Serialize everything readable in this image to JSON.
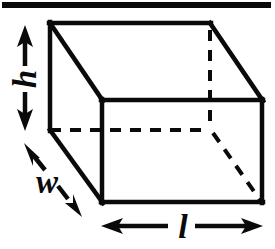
{
  "figure": {
    "kind": "geometry-diagram",
    "ink_color": "#0a0a0a",
    "background_color": "#ffffff",
    "stroke_width_solid": 4,
    "stroke_width_dashed": 4
  },
  "top_rule": {
    "name": "page-rule",
    "x1": 2,
    "y1": 5,
    "x2": 271,
    "y2": 5,
    "thickness": 6
  },
  "box": {
    "front_face": {
      "top_left": [
        102,
        100
      ],
      "top_right": [
        262,
        100
      ],
      "bottom_right": [
        262,
        202
      ],
      "bottom_left": [
        102,
        202
      ]
    },
    "back_face": {
      "top_left": [
        50,
        23
      ],
      "top_right": [
        210,
        23
      ],
      "bottom_right": [
        211,
        130
      ],
      "bottom_left": [
        50,
        130
      ]
    },
    "visible_edges": [
      "back-top",
      "back-left-vertical",
      "front-top",
      "front-right-vertical",
      "front-bottom",
      "front-left-vertical",
      "top-left-diagonal",
      "top-right-diagonal",
      "bottom-left-diagonal"
    ],
    "hidden_edges": [
      "back-right-vertical",
      "back-bottom-horizontal",
      "bottom-right-diagonal"
    ]
  },
  "dimensions": [
    {
      "id": "height",
      "label": "h",
      "orientation": "vertical",
      "arrow": {
        "x1": 25,
        "y1": 27,
        "x2": 25,
        "y2": 128
      },
      "label_pos": {
        "x": 25,
        "y": 83
      },
      "double_headed": true
    },
    {
      "id": "width",
      "label": "w",
      "orientation": "diagonal",
      "arrow": {
        "x1": 28,
        "y1": 148,
        "x2": 79,
        "y2": 213
      },
      "label_pos": {
        "x": 47,
        "y": 192
      },
      "double_headed": true
    },
    {
      "id": "length",
      "label": "l",
      "orientation": "horizontal",
      "arrow": {
        "x1": 103,
        "y1": 226,
        "x2": 262,
        "y2": 226
      },
      "label_pos": {
        "x": 184,
        "y": 236
      },
      "double_headed": true
    }
  ]
}
